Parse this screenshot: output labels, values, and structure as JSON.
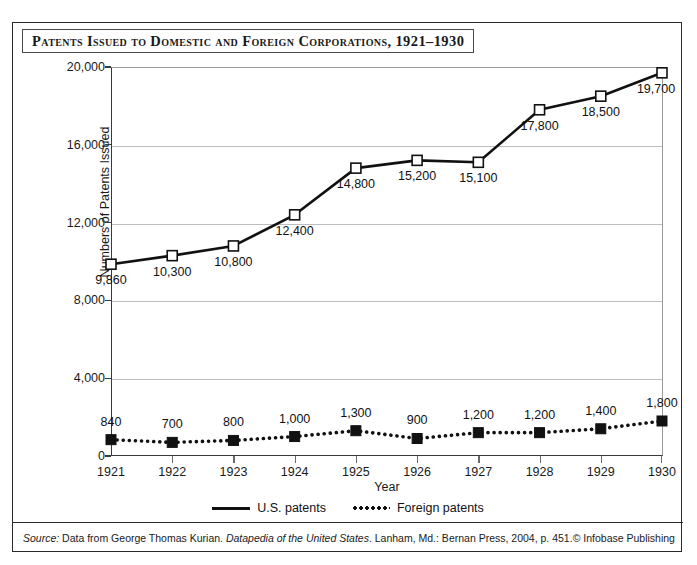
{
  "figure": {
    "title": "Patents Issued to Domestic and Foreign Corporations, 1921–1930",
    "source_prefix": "Source:",
    "source_body_1": " Data from George Thomas Kurian. ",
    "source_italic": "Datapedia of the United States",
    "source_body_2": ". Lanham, Md.: Bernan Press, 2004, p. 451.",
    "credit": "© Infobase Publishing"
  },
  "legend": {
    "items": [
      {
        "label": "U.S. patents",
        "style": "solid",
        "color": "#111111"
      },
      {
        "label": "Foreign patents",
        "style": "dotted",
        "color": "#111111"
      }
    ]
  },
  "chart_data": {
    "type": "line",
    "title": "Patents Issued to Domestic and Foreign Corporations, 1921–1930",
    "xlabel": "Year",
    "ylabel": "Numbers of Patents Issued",
    "categories": [
      "1921",
      "1922",
      "1923",
      "1924",
      "1925",
      "1926",
      "1927",
      "1928",
      "1929",
      "1930"
    ],
    "x": [
      1921,
      1922,
      1923,
      1924,
      1925,
      1926,
      1927,
      1928,
      1929,
      1930
    ],
    "ylim": [
      0,
      20000
    ],
    "xlim": [
      1921,
      1930
    ],
    "yticks": [
      0,
      4000,
      8000,
      12000,
      16000,
      20000
    ],
    "ytick_labels": [
      "0",
      "4,000",
      "8,000",
      "12,000",
      "16,000",
      "20,000"
    ],
    "grid": true,
    "legend_position": "bottom",
    "series": [
      {
        "name": "U.S. patents",
        "marker": "open-square",
        "line": "solid",
        "color": "#111111",
        "values": [
          9860,
          10300,
          10800,
          12400,
          14800,
          15200,
          15100,
          17800,
          18500,
          19700
        ],
        "data_labels": [
          "9,860",
          "10,300",
          "10,800",
          "12,400",
          "14,800",
          "15,200",
          "15,100",
          "17,800",
          "18,500",
          "19,700"
        ]
      },
      {
        "name": "Foreign patents",
        "marker": "filled-square",
        "line": "dotted",
        "color": "#111111",
        "values": [
          840,
          700,
          800,
          1000,
          1300,
          900,
          1200,
          1200,
          1400,
          1800
        ],
        "data_labels": [
          "840",
          "700",
          "800",
          "1,000",
          "1,300",
          "900",
          "1,200",
          "1,200",
          "1,400",
          "1,800"
        ]
      }
    ]
  }
}
